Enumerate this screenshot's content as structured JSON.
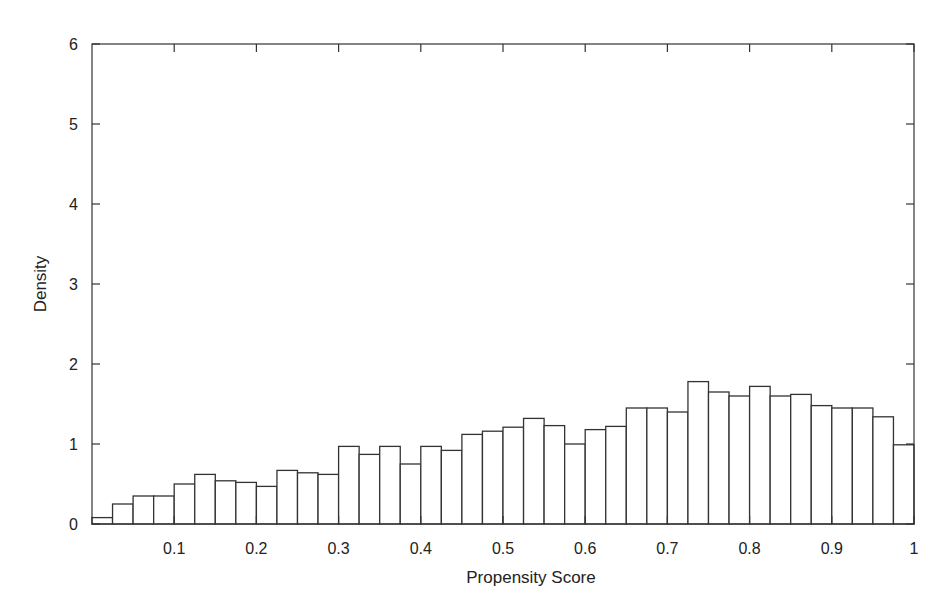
{
  "chart_data": {
    "type": "bar",
    "subtype": "histogram",
    "title": "",
    "xlabel": "Propensity Score",
    "ylabel": "Density",
    "xlim": [
      0,
      1
    ],
    "ylim": [
      0,
      6
    ],
    "grid": false,
    "legend": null,
    "bin_width": 0.025,
    "bin_edges_start": 0,
    "x_ticks": [
      "0.1",
      "0.2",
      "0.3",
      "0.4",
      "0.5",
      "0.6",
      "0.7",
      "0.8",
      "0.9",
      "1"
    ],
    "x_tick_values": [
      0.1,
      0.2,
      0.3,
      0.4,
      0.5,
      0.6,
      0.7,
      0.8,
      0.9,
      1.0
    ],
    "y_ticks": [
      "0",
      "1",
      "2",
      "3",
      "4",
      "5",
      "6"
    ],
    "y_tick_values": [
      0,
      1,
      2,
      3,
      4,
      5,
      6
    ],
    "categories": [
      "0.0125",
      "0.0375",
      "0.0625",
      "0.0875",
      "0.1125",
      "0.1375",
      "0.1625",
      "0.1875",
      "0.2125",
      "0.2375",
      "0.2625",
      "0.2875",
      "0.3125",
      "0.3375",
      "0.3625",
      "0.3875",
      "0.4125",
      "0.4375",
      "0.4625",
      "0.4875",
      "0.5125",
      "0.5375",
      "0.5625",
      "0.5875",
      "0.6125",
      "0.6375",
      "0.6625",
      "0.6875",
      "0.7125",
      "0.7375",
      "0.7625",
      "0.7875",
      "0.8125",
      "0.8375",
      "0.8625",
      "0.8875",
      "0.9125",
      "0.9375",
      "0.9625",
      "0.9875"
    ],
    "values": [
      0.08,
      0.25,
      0.35,
      0.35,
      0.5,
      0.62,
      0.54,
      0.52,
      0.47,
      0.67,
      0.64,
      0.62,
      0.97,
      0.87,
      0.97,
      0.75,
      0.97,
      0.92,
      1.12,
      1.16,
      1.21,
      1.32,
      1.23,
      1.0,
      1.18,
      1.22,
      1.45,
      1.45,
      1.4,
      1.78,
      1.65,
      1.6,
      1.72,
      1.6,
      1.62,
      1.48,
      1.45,
      1.45,
      1.34,
      0.99
    ],
    "bar_fill": "#ffffff",
    "bar_stroke": "#333333"
  },
  "axes": {
    "x_title": "Propensity Score",
    "y_title": "Density"
  }
}
